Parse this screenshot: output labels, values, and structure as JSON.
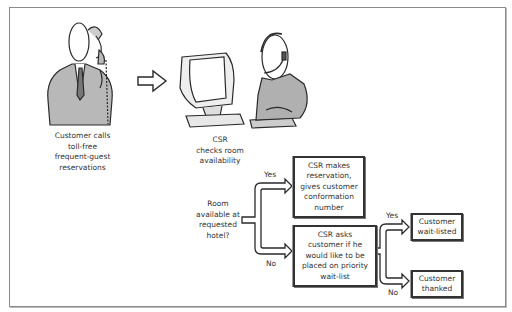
{
  "diagram": {
    "title": "",
    "steps": {
      "customer_call": "Customer calls\ntoll-free\nfrequent-guest\nreservations",
      "csr_check": "CSR\nchecks room\navailability",
      "decision_room": "Room\navailable at\nrequested\nhotel?",
      "csr_reserve": "CSR makes\nreservation,\ngives customer\nconformation\nnumber",
      "csr_ask_waitlist": "CSR asks\ncustomer if he\nwould like to be\nplaced on priority\nwait-list",
      "customer_waitlisted": "Customer\nwait-listed",
      "customer_thanked": "Customer\nthanked"
    },
    "branches": {
      "room_yes": "Yes",
      "room_no": "No",
      "wait_yes": "Yes",
      "wait_no": "No"
    },
    "illustrations": {
      "customer": "customer-on-phone-illustration",
      "csr": "csr-at-computer-illustration"
    },
    "colors": {
      "ink": "#2a2a2a",
      "frame": "#8a8a8a",
      "shade": "#9a9a9a",
      "background": "#ffffff"
    }
  }
}
